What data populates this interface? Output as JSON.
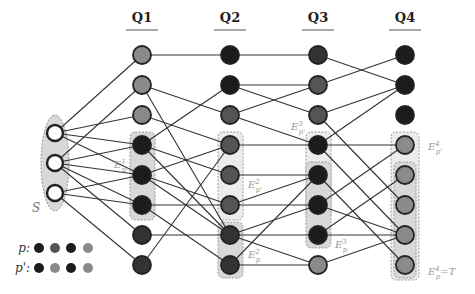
{
  "figure": {
    "type": "layered query graph",
    "columns": [
      {
        "id": "Q1",
        "label": "Q1",
        "x": 142
      },
      {
        "id": "Q2",
        "label": "Q2",
        "x": 230
      },
      {
        "id": "Q3",
        "label": "Q3",
        "x": 318
      },
      {
        "id": "Q4",
        "label": "Q4",
        "x": 405
      }
    ],
    "source_group": {
      "label": "S",
      "nodes": [
        {
          "x": 55,
          "y": 133
        },
        {
          "x": 55,
          "y": 163
        },
        {
          "x": 55,
          "y": 193
        }
      ]
    },
    "colors": {
      "white": "#ffffff",
      "black": "#1c1c1c",
      "dark": "#333333",
      "mid": "#555555",
      "light": "#8a8a8a",
      "group_fill": "#d8d8d8",
      "group_fill_light": "#ececec",
      "stroke": "#222222",
      "edge": "#333333"
    },
    "nodes": {
      "Q1": [
        {
          "y": 55,
          "fill": "light"
        },
        {
          "y": 85,
          "fill": "light"
        },
        {
          "y": 115,
          "fill": "light"
        },
        {
          "y": 145,
          "fill": "black"
        },
        {
          "y": 175,
          "fill": "black"
        },
        {
          "y": 205,
          "fill": "black"
        },
        {
          "y": 235,
          "fill": "dark"
        },
        {
          "y": 265,
          "fill": "dark"
        }
      ],
      "Q2": [
        {
          "y": 55,
          "fill": "black"
        },
        {
          "y": 85,
          "fill": "black"
        },
        {
          "y": 115,
          "fill": "mid"
        },
        {
          "y": 145,
          "fill": "mid"
        },
        {
          "y": 175,
          "fill": "mid"
        },
        {
          "y": 205,
          "fill": "mid"
        },
        {
          "y": 235,
          "fill": "dark"
        },
        {
          "y": 265,
          "fill": "dark"
        }
      ],
      "Q3": [
        {
          "y": 55,
          "fill": "dark"
        },
        {
          "y": 85,
          "fill": "mid"
        },
        {
          "y": 115,
          "fill": "mid"
        },
        {
          "y": 145,
          "fill": "black"
        },
        {
          "y": 175,
          "fill": "black"
        },
        {
          "y": 205,
          "fill": "black"
        },
        {
          "y": 235,
          "fill": "black"
        },
        {
          "y": 265,
          "fill": "light"
        }
      ],
      "Q4": [
        {
          "y": 55,
          "fill": "black"
        },
        {
          "y": 85,
          "fill": "black"
        },
        {
          "y": 115,
          "fill": "black"
        },
        {
          "y": 145,
          "fill": "light"
        },
        {
          "y": 175,
          "fill": "light"
        },
        {
          "y": 205,
          "fill": "light"
        },
        {
          "y": 235,
          "fill": "light"
        },
        {
          "y": 265,
          "fill": "light"
        }
      ]
    },
    "edges": [
      [
        55,
        133,
        142,
        55
      ],
      [
        55,
        133,
        142,
        115
      ],
      [
        55,
        133,
        142,
        145
      ],
      [
        55,
        133,
        142,
        175
      ],
      [
        55,
        163,
        142,
        85
      ],
      [
        55,
        163,
        142,
        145
      ],
      [
        55,
        163,
        142,
        175
      ],
      [
        55,
        163,
        142,
        205
      ],
      [
        55,
        163,
        142,
        235
      ],
      [
        55,
        193,
        142,
        175
      ],
      [
        55,
        193,
        142,
        205
      ],
      [
        55,
        193,
        142,
        265
      ],
      [
        142,
        55,
        230,
        55
      ],
      [
        142,
        85,
        230,
        115
      ],
      [
        142,
        85,
        230,
        235
      ],
      [
        142,
        115,
        230,
        145
      ],
      [
        142,
        145,
        230,
        85
      ],
      [
        142,
        145,
        230,
        175
      ],
      [
        142,
        145,
        230,
        235
      ],
      [
        142,
        175,
        230,
        145
      ],
      [
        142,
        175,
        230,
        205
      ],
      [
        142,
        175,
        230,
        235
      ],
      [
        142,
        205,
        230,
        265
      ],
      [
        142,
        205,
        230,
        205
      ],
      [
        142,
        235,
        230,
        235
      ],
      [
        142,
        265,
        230,
        145
      ],
      [
        230,
        55,
        318,
        55
      ],
      [
        230,
        85,
        318,
        85
      ],
      [
        230,
        85,
        318,
        115
      ],
      [
        230,
        115,
        318,
        85
      ],
      [
        230,
        115,
        318,
        145
      ],
      [
        230,
        145,
        318,
        145
      ],
      [
        230,
        175,
        318,
        175
      ],
      [
        230,
        205,
        318,
        175
      ],
      [
        230,
        205,
        318,
        205
      ],
      [
        230,
        235,
        318,
        205
      ],
      [
        230,
        235,
        318,
        235
      ],
      [
        230,
        235,
        318,
        265
      ],
      [
        230,
        265,
        318,
        175
      ],
      [
        230,
        265,
        318,
        265
      ],
      [
        318,
        55,
        405,
        85
      ],
      [
        318,
        85,
        405,
        55
      ],
      [
        318,
        115,
        405,
        85
      ],
      [
        318,
        115,
        405,
        205
      ],
      [
        318,
        145,
        405,
        85
      ],
      [
        318,
        145,
        405,
        145
      ],
      [
        318,
        145,
        405,
        235
      ],
      [
        318,
        175,
        405,
        265
      ],
      [
        318,
        205,
        405,
        145
      ],
      [
        318,
        205,
        405,
        235
      ],
      [
        318,
        235,
        405,
        175
      ],
      [
        318,
        235,
        405,
        235
      ],
      [
        318,
        265,
        405,
        235
      ]
    ],
    "groups": [
      {
        "id": "E_p1",
        "label": "E_p^1",
        "x": 130,
        "y": 132,
        "w": 25,
        "h": 88,
        "fill": "group_fill",
        "label_x": 114,
        "label_y": 168
      },
      {
        "id": "E_p2",
        "label": "E_p^2",
        "x": 218,
        "y": 222,
        "w": 25,
        "h": 56,
        "fill": "group_fill",
        "label_x": 248,
        "label_y": 258
      },
      {
        "id": "E_pprime2",
        "label": "E_{p'}^2",
        "x": 218,
        "y": 132,
        "w": 25,
        "h": 88,
        "fill": "group_fill_light",
        "label_x": 248,
        "label_y": 188
      },
      {
        "id": "E_pprime3",
        "label": "E_{p'}^3",
        "x": 306,
        "y": 132,
        "w": 25,
        "h": 88,
        "fill": "group_fill_light",
        "label_x": 291,
        "label_y": 130
      },
      {
        "id": "E_p3",
        "label": "E_p^3",
        "x": 306,
        "y": 162,
        "w": 25,
        "h": 86,
        "fill": "group_fill",
        "label_x": 335,
        "label_y": 248
      },
      {
        "id": "E_pprime4",
        "label": "E_{p'}^4",
        "x": 391,
        "y": 132,
        "w": 28,
        "h": 148,
        "fill": "group_fill_light",
        "label_x": 428,
        "label_y": 150
      },
      {
        "id": "E_p4",
        "label": "E_p^4 = T",
        "x": 394,
        "y": 162,
        "w": 22,
        "h": 116,
        "fill": "group_fill",
        "label_x": 428,
        "label_y": 275
      }
    ],
    "legend": {
      "rows": [
        {
          "label": "p:",
          "y": 248,
          "colors": [
            "black",
            "mid",
            "black",
            "light"
          ]
        },
        {
          "label": "p':",
          "y": 268,
          "colors": [
            "black",
            "light",
            "black",
            "light"
          ]
        }
      ],
      "x_positions": [
        39,
        55,
        71,
        88
      ]
    }
  }
}
